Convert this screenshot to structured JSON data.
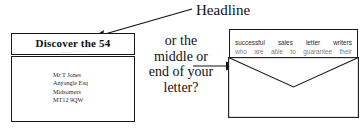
{
  "diagram": {
    "callout": {
      "headline_label": "Headline",
      "arrow_name": "headline-pointer-arrow"
    },
    "middle_caption": {
      "line1": "or the",
      "line2": "middle or",
      "line3": "end of your",
      "line4": "letter?",
      "arrow_name": "caption-pointer-arrow"
    },
    "left_envelope": {
      "name": "left-envelope",
      "window_headline": "Discover the 54",
      "window_subline": "—        —····  · ·",
      "address": [
        "Mr T Jones",
        "Anyangle Esq",
        "Midsomers",
        "MT12 9QW"
      ]
    },
    "right_envelope": {
      "name": "right-envelope",
      "line1_words": [
        "successful",
        "sales",
        "letter",
        "writers"
      ],
      "line2_words": [
        "who",
        "are",
        "able",
        "to",
        "guarantee",
        "their"
      ],
      "line1_text": "successful sales letter writers",
      "line2_text": "who are able to guarantee their"
    },
    "colors": {
      "ink": "#1a1a1a",
      "paper": "#ffffff",
      "faded_ink": "#a8a8a8",
      "body_ink": "#2b2b2b"
    }
  }
}
